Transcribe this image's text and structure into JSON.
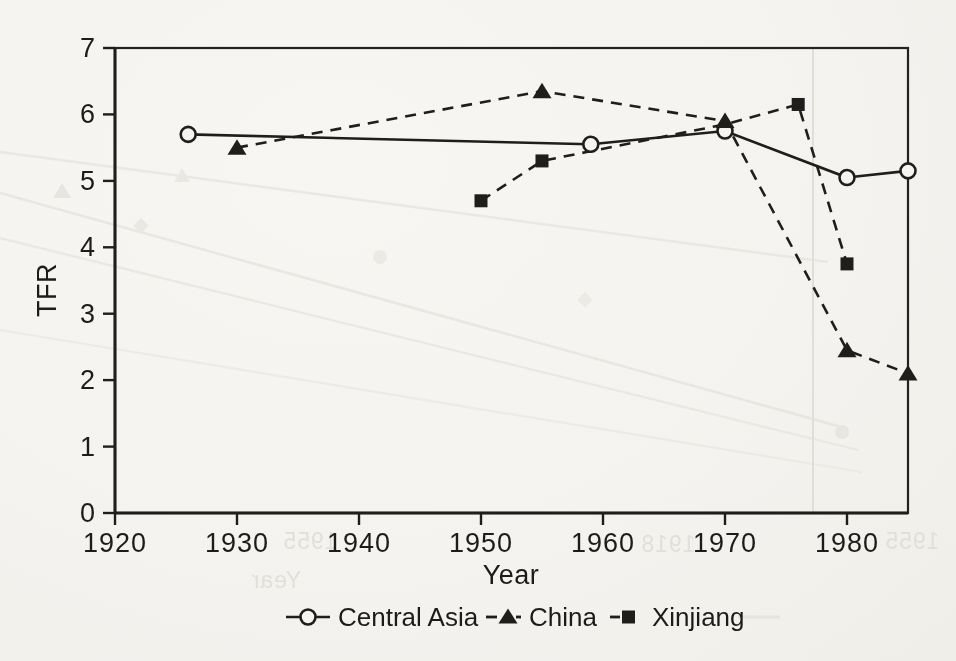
{
  "chart_data": {
    "type": "line",
    "title": "",
    "xlabel": "Year",
    "ylabel": "TFR",
    "xlim": [
      1920,
      1985
    ],
    "ylim": [
      0,
      7
    ],
    "x_ticks": [
      1920,
      1930,
      1940,
      1950,
      1960,
      1970,
      1980
    ],
    "y_ticks": [
      0,
      1,
      2,
      3,
      4,
      5,
      6,
      7
    ],
    "grid": false,
    "legend_position": "bottom",
    "series": [
      {
        "name": "Central Asia",
        "marker": "open-circle",
        "line_style": "solid",
        "points": [
          [
            1926,
            5.7
          ],
          [
            1959,
            5.55
          ],
          [
            1970,
            5.75
          ],
          [
            1980,
            5.05
          ],
          [
            1985,
            5.15
          ]
        ]
      },
      {
        "name": "China",
        "marker": "filled-triangle",
        "line_style": "dashed",
        "points": [
          [
            1930,
            5.5
          ],
          [
            1955,
            6.35
          ],
          [
            1970,
            5.9
          ],
          [
            1980,
            2.45
          ],
          [
            1985,
            2.1
          ]
        ]
      },
      {
        "name": "Xinjiang",
        "marker": "filled-square",
        "line_style": "dashed",
        "points": [
          [
            1950,
            4.7
          ],
          [
            1955,
            5.3
          ],
          [
            1970,
            5.85
          ],
          [
            1976,
            6.15
          ],
          [
            1980,
            3.75
          ]
        ],
        "marker_hidden_indices": [
          2
        ]
      }
    ]
  },
  "colors": {
    "ink": "#1f1e1c",
    "paper": "#f5f4f0",
    "ghost": "#e4e3dd"
  },
  "ghosting": {
    "texts": [
      "1955",
      "1918",
      "1955",
      "Year"
    ]
  }
}
